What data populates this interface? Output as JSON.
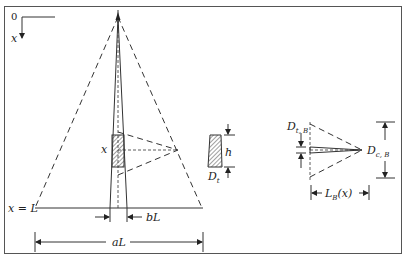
{
  "figure": {
    "origin_label": "0",
    "axis_label": "x",
    "base_label": "x = L",
    "element_label": "x",
    "width_label_b": "bL",
    "width_label_a": "aL",
    "element_height_label": "h",
    "element_diameter_label": "D",
    "element_diameter_sub": "t",
    "branch_tip_label": "D",
    "branch_tip_sub": "t, B",
    "branch_crown_label": "D",
    "branch_crown_sub": "c, B",
    "branch_length_label": "L",
    "branch_length_sub": "B",
    "branch_length_arg": "(x)"
  }
}
